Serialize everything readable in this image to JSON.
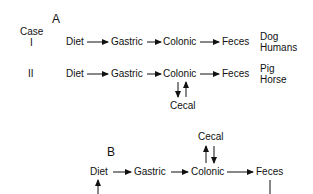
{
  "diagram": {
    "panel_a": {
      "label": "A",
      "case_header": "Case",
      "rows": [
        {
          "case": "I",
          "nodes": [
            "Diet",
            "Gastric",
            "Colonic",
            "Feces"
          ],
          "species": [
            "Dog",
            "Humans"
          ]
        },
        {
          "case": "II",
          "nodes": [
            "Diet",
            "Gastric",
            "Colonic",
            "Feces"
          ],
          "species": [
            "Pig",
            "Horse"
          ],
          "side_node": "Cecal"
        }
      ]
    },
    "panel_b": {
      "label": "B",
      "nodes": [
        "Diet",
        "Gastric",
        "Colonic",
        "Feces"
      ],
      "side_node": "Cecal"
    }
  }
}
